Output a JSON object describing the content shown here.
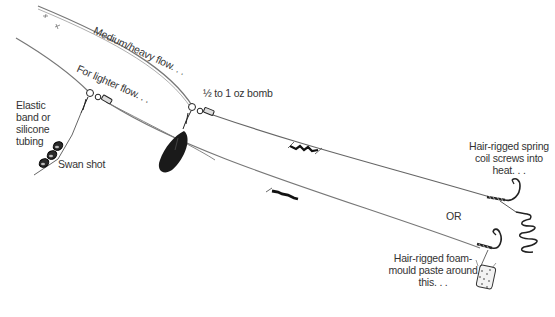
{
  "diagram": {
    "labels": {
      "medium_heavy_flow": "Medium/heavy flow. . .",
      "lighter_flow": "For lighter flow. . .",
      "bomb": "½ to 1 oz bomb",
      "elastic_line1": "Elastic",
      "elastic_line2": "band or",
      "elastic_line3": "silicone",
      "elastic_line4": "tubing",
      "swan_shot": "Swan shot",
      "spring_line1": "Hair-rigged spring",
      "spring_line2": "coil screws into",
      "spring_line3": "heat. . .",
      "or": "OR",
      "foam_line1": "Hair-rigged foam-",
      "foam_line2": "mould paste around",
      "foam_line3": "this. . ."
    },
    "components": [
      {
        "id": "main-line-heavy",
        "type": "line"
      },
      {
        "id": "main-line-light",
        "type": "line"
      },
      {
        "id": "bomb-weight",
        "type": "weight"
      },
      {
        "id": "swan-shot-link",
        "type": "weights"
      },
      {
        "id": "swivel-heavy",
        "type": "swivel"
      },
      {
        "id": "swivel-light",
        "type": "swivel"
      },
      {
        "id": "hook-spring",
        "type": "hook"
      },
      {
        "id": "spring-coil",
        "type": "bait-holder"
      },
      {
        "id": "hook-foam",
        "type": "hook"
      },
      {
        "id": "foam-bait",
        "type": "bait"
      }
    ],
    "colors": {
      "ink": "#1a1a1a",
      "line": "#555555",
      "text": "#333333"
    }
  }
}
